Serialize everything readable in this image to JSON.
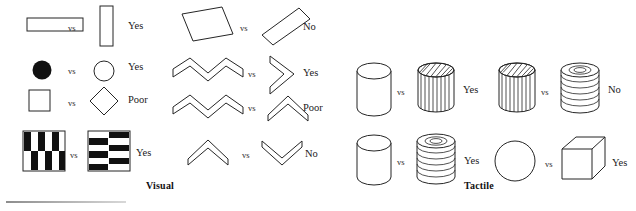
{
  "figure": {
    "panels": [
      {
        "id": "visual",
        "label": "Visual",
        "rows": [
          {
            "left_shape": "horizontal-rectangle",
            "right_shape": "vertical-rectangle",
            "separator": "vs",
            "verdict": "Yes"
          },
          {
            "left_shape": "filled-circle",
            "right_shape": "open-circle",
            "separator": "vs",
            "verdict": "Yes"
          },
          {
            "left_shape": "square",
            "right_shape": "diamond",
            "separator": "vs",
            "verdict": "Poor"
          },
          {
            "left_shape": "vertical-stripe-checkerboard",
            "right_shape": "horizontal-stripe-checkerboard",
            "separator": "vs",
            "verdict": "Yes"
          }
        ],
        "rows_right": [
          {
            "left_shape": "rectangle-tilted-down",
            "right_shape": "rectangle-tilted-up",
            "separator": "vs",
            "verdict": "No"
          },
          {
            "left_shape": "zigzag-four-peaks",
            "right_shape": "chevron-right",
            "separator": "vs",
            "verdict": "Yes"
          },
          {
            "left_shape": "zigzag-three-peaks",
            "right_shape": "chevron-up",
            "separator": "vs",
            "verdict": "Poor"
          },
          {
            "left_shape": "chevron-up-small",
            "right_shape": "chevron-down-small",
            "separator": "vs",
            "verdict": "No"
          }
        ]
      },
      {
        "id": "tactile",
        "label": "Tactile",
        "rows": [
          {
            "left_shape": "smooth-cylinder",
            "right_shape": "fluted-cylinder",
            "separator": "vs",
            "verdict": "Yes"
          },
          {
            "left_shape": "smooth-cylinder",
            "right_shape": "ribbed-cylinder",
            "separator": "vs",
            "verdict": "Yes"
          }
        ],
        "rows_right": [
          {
            "left_shape": "fluted-cylinder",
            "right_shape": "ribbed-cylinder",
            "separator": "vs",
            "verdict": "No"
          },
          {
            "left_shape": "sphere",
            "right_shape": "cube",
            "separator": "vs",
            "verdict": "Yes"
          }
        ]
      }
    ]
  },
  "colors": {
    "ink": "#252525",
    "fill_black": "#111111",
    "paper": "#ffffff",
    "rule": "#8d8d8d"
  }
}
